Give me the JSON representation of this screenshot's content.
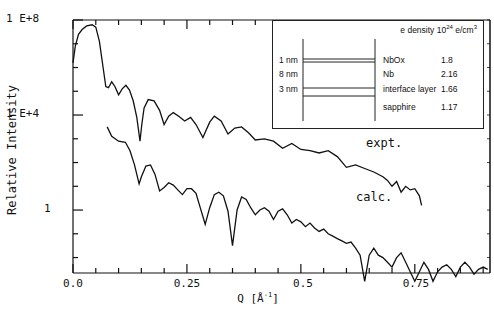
{
  "chart_data": {
    "type": "line",
    "title": "",
    "xlabel": "Q [Å⁻¹]",
    "ylabel": "Relative Intensity",
    "xscale": "linear",
    "yscale": "log",
    "xlim": [
      0.0,
      0.915
    ],
    "ylim_log10": [
      -2.65,
      8
    ],
    "xticks": [
      0.0,
      0.25,
      0.5,
      0.75
    ],
    "xtick_labels": [
      "0.0",
      "0.25",
      "0.5",
      "0.75"
    ],
    "yticks_log10": [
      8,
      4,
      0
    ],
    "ytick_labels": [
      "1 E+8",
      "1 E+4",
      "1"
    ],
    "grid": false,
    "annotations": [
      "expt.",
      "calc."
    ],
    "series": [
      {
        "name": "expt.",
        "x": [
          0.0,
          0.005,
          0.012,
          0.02,
          0.03,
          0.042,
          0.05,
          0.058,
          0.066,
          0.072,
          0.078,
          0.085,
          0.092,
          0.1,
          0.108,
          0.116,
          0.124,
          0.132,
          0.14,
          0.147,
          0.151,
          0.156,
          0.165,
          0.178,
          0.19,
          0.2,
          0.21,
          0.22,
          0.232,
          0.245,
          0.258,
          0.27,
          0.285,
          0.3,
          0.31,
          0.325,
          0.34,
          0.355,
          0.37,
          0.385,
          0.4,
          0.42,
          0.44,
          0.46,
          0.48,
          0.5,
          0.52,
          0.54,
          0.56,
          0.58,
          0.6,
          0.62,
          0.64,
          0.66,
          0.68,
          0.69,
          0.7,
          0.71,
          0.72,
          0.73,
          0.74,
          0.75,
          0.76,
          0.765
        ],
        "log10_y": [
          6.2,
          6.9,
          7.4,
          7.6,
          7.75,
          7.8,
          7.7,
          7.1,
          6.0,
          5.2,
          5.15,
          5.4,
          5.2,
          4.85,
          5.1,
          5.25,
          5.05,
          4.6,
          3.9,
          2.9,
          3.6,
          4.3,
          4.65,
          4.6,
          4.2,
          3.6,
          3.95,
          4.1,
          3.95,
          3.75,
          3.9,
          3.6,
          3.05,
          3.7,
          3.95,
          3.75,
          3.2,
          3.45,
          3.5,
          3.25,
          2.95,
          3.0,
          2.9,
          2.6,
          2.8,
          2.55,
          2.5,
          2.4,
          2.5,
          2.25,
          1.8,
          1.9,
          1.75,
          1.6,
          1.4,
          1.25,
          1.0,
          1.2,
          0.75,
          1.0,
          0.85,
          0.9,
          0.6,
          0.2
        ]
      },
      {
        "name": "calc.",
        "x": [
          0.075,
          0.085,
          0.1,
          0.115,
          0.125,
          0.135,
          0.145,
          0.15,
          0.16,
          0.17,
          0.18,
          0.19,
          0.2,
          0.21,
          0.22,
          0.23,
          0.24,
          0.25,
          0.26,
          0.27,
          0.28,
          0.29,
          0.3,
          0.31,
          0.32,
          0.33,
          0.34,
          0.35,
          0.36,
          0.37,
          0.38,
          0.39,
          0.4,
          0.41,
          0.42,
          0.43,
          0.44,
          0.45,
          0.46,
          0.47,
          0.48,
          0.49,
          0.5,
          0.51,
          0.52,
          0.53,
          0.54,
          0.55,
          0.56,
          0.57,
          0.58,
          0.59,
          0.6,
          0.61,
          0.62,
          0.63,
          0.64,
          0.65,
          0.66,
          0.67,
          0.68,
          0.69,
          0.7,
          0.71,
          0.72,
          0.73,
          0.74,
          0.75,
          0.76,
          0.77,
          0.78,
          0.79,
          0.8,
          0.81,
          0.82,
          0.83,
          0.84,
          0.85,
          0.86,
          0.87,
          0.88,
          0.89,
          0.9,
          0.91
        ],
        "log10_y": [
          3.5,
          3.1,
          2.9,
          2.85,
          2.5,
          1.9,
          1.1,
          1.4,
          1.85,
          1.9,
          1.5,
          0.8,
          0.95,
          1.15,
          1.05,
          0.85,
          0.65,
          0.9,
          0.9,
          0.7,
          0.05,
          -0.6,
          0.1,
          0.65,
          0.75,
          0.6,
          -0.05,
          -1.5,
          0.0,
          0.55,
          0.45,
          0.1,
          -0.2,
          0.0,
          0.1,
          -0.05,
          -0.4,
          -0.05,
          0.05,
          -0.2,
          -0.55,
          -0.4,
          -0.5,
          -0.7,
          -0.55,
          -0.75,
          -0.9,
          -0.8,
          -1.0,
          -1.1,
          -1.2,
          -1.3,
          -1.4,
          -1.35,
          -1.6,
          -1.9,
          -3.0,
          -1.9,
          -1.6,
          -1.9,
          -2.0,
          -2.2,
          -2.4,
          -2.0,
          -1.8,
          -2.2,
          -2.6,
          -3.0,
          -2.6,
          -2.2,
          -2.5,
          -3.0,
          -2.6,
          -2.4,
          -2.3,
          -2.5,
          -2.8,
          -2.4,
          -2.2,
          -2.4,
          -2.7,
          -2.5,
          -2.4,
          -2.5
        ]
      }
    ],
    "inset": {
      "header": "e density 10",
      "header_exp": "24",
      "header_unit": "e/cm",
      "header_unit_exp": "3",
      "layers": [
        {
          "thickness": "1 nm",
          "name": "NbOx",
          "density": "1.8"
        },
        {
          "thickness": "8 nm",
          "name": "Nb",
          "density": "2.16"
        },
        {
          "thickness": "3 nm",
          "name": "interface layer",
          "density": "1.66"
        },
        {
          "thickness": "",
          "name": "sapphire",
          "density": "1.17"
        }
      ]
    }
  },
  "axes": {
    "ylabel": "Relative Intensity",
    "xlabel_main": "Q [Å",
    "xlabel_exp": "-1",
    "xlabel_close": "]",
    "xticks": [
      "0.0",
      "0.25",
      "0.5",
      "0.75"
    ],
    "yticks": [
      "1 E+8",
      "1 E+4",
      "1"
    ]
  },
  "annotations": {
    "expt": "expt.",
    "calc": "calc."
  },
  "caption": "Fig. X-ray reflectivity of Nb film on sapphire"
}
